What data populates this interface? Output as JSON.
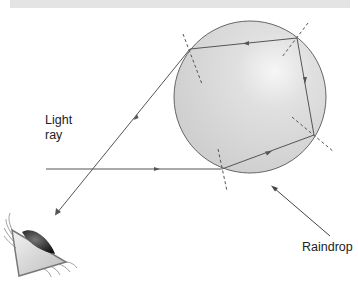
{
  "diagram": {
    "labels": {
      "light_line1": "Light",
      "light_line2": "ray",
      "raindrop": "Raindrop"
    },
    "colors": {
      "drop_fill": "#d3d3d3",
      "drop_highlight": "#f4f4f4",
      "stroke": "#555555",
      "text": "#222222",
      "top_band": "#e4e4e4"
    },
    "icons": [
      "eye-icon",
      "arrow-icon"
    ],
    "points": {
      "entry": [
        222,
        169
      ],
      "reflect_1": [
        314,
        135
      ],
      "reflect_2": [
        297,
        38
      ],
      "exit": [
        190,
        49
      ]
    }
  }
}
